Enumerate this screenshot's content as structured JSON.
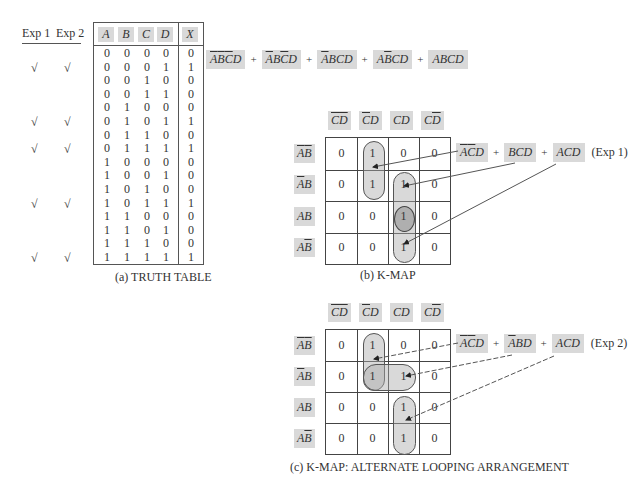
{
  "truth_table": {
    "exp_headers": [
      "Exp 1",
      "Exp 2"
    ],
    "columns": [
      "A",
      "B",
      "C",
      "D",
      "X"
    ],
    "rows": [
      {
        "A": "0",
        "B": "0",
        "C": "0",
        "D": "0",
        "X": "0",
        "exp1": "",
        "exp2": ""
      },
      {
        "A": "0",
        "B": "0",
        "C": "0",
        "D": "1",
        "X": "1",
        "exp1": "√",
        "exp2": "√"
      },
      {
        "A": "0",
        "B": "0",
        "C": "1",
        "D": "0",
        "X": "0",
        "exp1": "",
        "exp2": ""
      },
      {
        "A": "0",
        "B": "0",
        "C": "1",
        "D": "1",
        "X": "0",
        "exp1": "",
        "exp2": ""
      },
      {
        "A": "0",
        "B": "1",
        "C": "0",
        "D": "0",
        "X": "0",
        "exp1": "",
        "exp2": ""
      },
      {
        "A": "0",
        "B": "1",
        "C": "0",
        "D": "1",
        "X": "1",
        "exp1": "√",
        "exp2": "√"
      },
      {
        "A": "0",
        "B": "1",
        "C": "1",
        "D": "0",
        "X": "0",
        "exp1": "",
        "exp2": ""
      },
      {
        "A": "0",
        "B": "1",
        "C": "1",
        "D": "1",
        "X": "1",
        "exp1": "√",
        "exp2": "√"
      },
      {
        "A": "1",
        "B": "0",
        "C": "0",
        "D": "0",
        "X": "0",
        "exp1": "",
        "exp2": ""
      },
      {
        "A": "1",
        "B": "0",
        "C": "0",
        "D": "1",
        "X": "0",
        "exp1": "",
        "exp2": ""
      },
      {
        "A": "1",
        "B": "0",
        "C": "1",
        "D": "0",
        "X": "0",
        "exp1": "",
        "exp2": ""
      },
      {
        "A": "1",
        "B": "0",
        "C": "1",
        "D": "1",
        "X": "1",
        "exp1": "√",
        "exp2": "√"
      },
      {
        "A": "1",
        "B": "1",
        "C": "0",
        "D": "0",
        "X": "0",
        "exp1": "",
        "exp2": ""
      },
      {
        "A": "1",
        "B": "1",
        "C": "0",
        "D": "1",
        "X": "0",
        "exp1": "",
        "exp2": ""
      },
      {
        "A": "1",
        "B": "1",
        "C": "1",
        "D": "0",
        "X": "0",
        "exp1": "",
        "exp2": ""
      },
      {
        "A": "1",
        "B": "1",
        "C": "1",
        "D": "1",
        "X": "1",
        "exp1": "√",
        "exp2": "√"
      }
    ],
    "caption": "(a)  TRUTH TABLE"
  },
  "sop_expression": {
    "terms": [
      [
        {
          "t": "A",
          "bar": true
        },
        {
          "t": "B",
          "bar": true
        },
        {
          "t": "C",
          "bar": true
        },
        {
          "t": "D",
          "bar": false
        }
      ],
      [
        {
          "t": "A",
          "bar": true
        },
        {
          "t": "B",
          "bar": false
        },
        {
          "t": "C",
          "bar": true
        },
        {
          "t": "D",
          "bar": false
        }
      ],
      [
        {
          "t": "A",
          "bar": true
        },
        {
          "t": "B",
          "bar": false
        },
        {
          "t": "C",
          "bar": false
        },
        {
          "t": "D",
          "bar": false
        }
      ],
      [
        {
          "t": "A",
          "bar": false
        },
        {
          "t": "B",
          "bar": true
        },
        {
          "t": "C",
          "bar": false
        },
        {
          "t": "D",
          "bar": false
        }
      ],
      [
        {
          "t": "A",
          "bar": false
        },
        {
          "t": "B",
          "bar": false
        },
        {
          "t": "C",
          "bar": false
        },
        {
          "t": "D",
          "bar": false
        }
      ]
    ],
    "plus": "+"
  },
  "kmap_col_headers": [
    [
      {
        "t": "C",
        "bar": true
      },
      {
        "t": "D",
        "bar": true
      }
    ],
    [
      {
        "t": "C",
        "bar": true
      },
      {
        "t": "D",
        "bar": false
      }
    ],
    [
      {
        "t": "C",
        "bar": false
      },
      {
        "t": "D",
        "bar": false
      }
    ],
    [
      {
        "t": "C",
        "bar": false
      },
      {
        "t": "D",
        "bar": true
      }
    ]
  ],
  "kmap_row_headers": [
    [
      {
        "t": "A",
        "bar": true
      },
      {
        "t": "B",
        "bar": true
      }
    ],
    [
      {
        "t": "A",
        "bar": true
      },
      {
        "t": "B",
        "bar": false
      }
    ],
    [
      {
        "t": "A",
        "bar": false
      },
      {
        "t": "B",
        "bar": false
      }
    ],
    [
      {
        "t": "A",
        "bar": false
      },
      {
        "t": "B",
        "bar": true
      }
    ]
  ],
  "kmap_values": [
    [
      "0",
      "1",
      "0",
      "0"
    ],
    [
      "0",
      "1",
      "1",
      "0"
    ],
    [
      "0",
      "0",
      "1",
      "0"
    ],
    [
      "0",
      "0",
      "1",
      "0"
    ]
  ],
  "kmap_b": {
    "caption": "(b)  K-MAP",
    "expression": [
      [
        {
          "t": "A",
          "bar": true
        },
        {
          "t": "C",
          "bar": true
        },
        {
          "t": "D",
          "bar": false
        }
      ],
      [
        {
          "t": "B",
          "bar": false
        },
        {
          "t": "C",
          "bar": false
        },
        {
          "t": "D",
          "bar": false
        }
      ],
      [
        {
          "t": "A",
          "bar": false
        },
        {
          "t": "C",
          "bar": false
        },
        {
          "t": "D",
          "bar": false
        }
      ]
    ],
    "label": "(Exp 1)"
  },
  "kmap_c": {
    "caption": "(c)  K-MAP: ALTERNATE LOOPING ARRANGEMENT",
    "expression": [
      [
        {
          "t": "A",
          "bar": true
        },
        {
          "t": "C",
          "bar": true
        },
        {
          "t": "D",
          "bar": false
        }
      ],
      [
        {
          "t": "A",
          "bar": true
        },
        {
          "t": "B",
          "bar": false
        },
        {
          "t": "D",
          "bar": false
        }
      ],
      [
        {
          "t": "A",
          "bar": false
        },
        {
          "t": "C",
          "bar": false
        },
        {
          "t": "D",
          "bar": false
        }
      ]
    ],
    "label": "(Exp 2)"
  },
  "colors": {
    "highlight": "#d9d9d9",
    "loop_fill": "#bdbdbd",
    "line": "#444444"
  }
}
